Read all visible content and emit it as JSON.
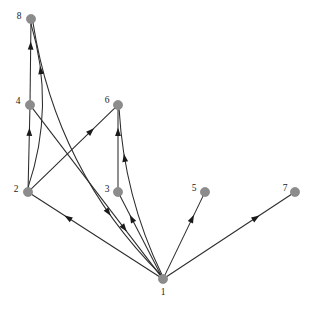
{
  "graph": {
    "title": "Directed Graph",
    "width": 312,
    "height": 312,
    "background_color": "#ffffff",
    "node_color": "#8c8c8c",
    "node_stroke_color": "#6f6f6f",
    "edge_color": "#2b2b2b",
    "label_color": "#1a1a1a",
    "node_radius": 4.6,
    "directed": true,
    "node_count": 8,
    "edge_count": 12,
    "nodes": [
      {
        "id": "1",
        "label": "1",
        "x": 163,
        "y": 279,
        "label_x": 163,
        "label_y": 293,
        "label_pos": "below"
      },
      {
        "id": "2",
        "label": "2",
        "x": 28,
        "y": 192,
        "label_x": 16,
        "label_y": 190,
        "label_pos": "left"
      },
      {
        "id": "3",
        "label": "3",
        "x": 118,
        "y": 192,
        "label_x": 107,
        "label_y": 190,
        "label_pos": "left"
      },
      {
        "id": "4",
        "label": "4",
        "x": 30,
        "y": 105,
        "label_x": 18,
        "label_y": 102,
        "label_pos": "left"
      },
      {
        "id": "5",
        "label": "5",
        "x": 205,
        "y": 192,
        "label_x": 194,
        "label_y": 189,
        "label_pos": "left"
      },
      {
        "id": "6",
        "label": "6",
        "x": 118,
        "y": 105,
        "label_x": 107,
        "label_y": 101,
        "label_pos": "left"
      },
      {
        "id": "7",
        "label": "7",
        "x": 295,
        "y": 192,
        "label_x": 285,
        "label_y": 189,
        "label_pos": "left"
      },
      {
        "id": "8",
        "label": "8",
        "x": 31,
        "y": 19,
        "label_x": 19,
        "label_y": 17,
        "label_pos": "left"
      }
    ],
    "edges": [
      {
        "from": "4",
        "to": "8",
        "curve": "straight",
        "label": "4 to 8"
      },
      {
        "from": "2",
        "to": "8",
        "curve": "curved",
        "label": "2 to 8"
      },
      {
        "from": "8",
        "to": "1",
        "curve": "curved",
        "label": "8 to 1"
      },
      {
        "from": "2",
        "to": "4",
        "curve": "straight",
        "label": "2 to 4"
      },
      {
        "from": "2",
        "to": "6",
        "curve": "straight",
        "label": "2 to 6"
      },
      {
        "from": "4",
        "to": "1",
        "curve": "straight",
        "label": "4 to 1"
      },
      {
        "from": "3",
        "to": "6",
        "curve": "straight",
        "label": "3 to 6"
      },
      {
        "from": "1",
        "to": "2",
        "curve": "straight",
        "label": "1 to 2"
      },
      {
        "from": "1",
        "to": "3",
        "curve": "straight",
        "label": "1 to 3"
      },
      {
        "from": "1",
        "to": "6",
        "curve": "curved",
        "label": "1 to 6"
      },
      {
        "from": "1",
        "to": "5",
        "curve": "straight",
        "label": "1 to 5"
      },
      {
        "from": "1",
        "to": "7",
        "curve": "straight",
        "label": "1 to 7"
      }
    ]
  }
}
